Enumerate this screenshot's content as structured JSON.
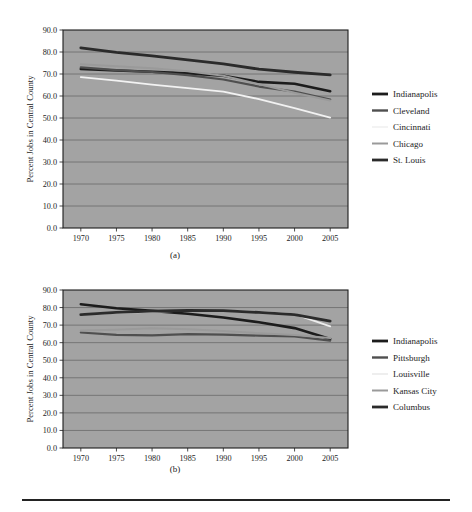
{
  "figure": {
    "caption_a": "(a)",
    "caption_b": "(b)"
  },
  "chart_data": [
    {
      "id": "a",
      "type": "line",
      "title": "",
      "xlabel": "Year",
      "ylabel": "Percent Jobs in Central County",
      "x": [
        1970,
        1975,
        1980,
        1985,
        1990,
        1995,
        2000,
        2005
      ],
      "xlim": [
        1967.5,
        2007.5
      ],
      "ylim": [
        0.0,
        90.0
      ],
      "xticks": [
        "1970",
        "1975",
        "1980",
        "1985",
        "1990",
        "1995",
        "2000",
        "2005"
      ],
      "yticks": [
        "0.0",
        "10.0",
        "20.0",
        "30.0",
        "40.0",
        "50.0",
        "60.0",
        "70.0",
        "80.0",
        "90.0"
      ],
      "grid": "horizontal",
      "legend_position": "right",
      "plot_background": "#a3a3a3",
      "gridline_color": "#6f6f6f",
      "series": [
        {
          "name": "Indianapolis",
          "color": "#1c1c1c",
          "width": 2.6,
          "values": [
            72.3,
            71.6,
            71.0,
            70.3,
            69.2,
            66.4,
            65.6,
            62.2
          ]
        },
        {
          "name": "Cleveland",
          "color": "#4f4f4f",
          "width": 2.2,
          "values": [
            73.0,
            71.8,
            70.9,
            69.5,
            67.5,
            64.3,
            62.0,
            58.4
          ]
        },
        {
          "name": "Cincinnati",
          "color": "#f2f2f2",
          "width": 1.8,
          "values": [
            68.6,
            67.0,
            65.2,
            63.6,
            62.0,
            58.6,
            54.5,
            50.2
          ]
        },
        {
          "name": "Chicago",
          "color": "#9a9a9a",
          "width": 2.0,
          "values": [
            74.4,
            73.5,
            72.6,
            71.3,
            69.2,
            65.4,
            61.5,
            58.0
          ]
        },
        {
          "name": "St. Louis",
          "color": "#2b2b2b",
          "width": 2.8,
          "values": [
            81.9,
            79.8,
            78.2,
            76.4,
            74.6,
            72.2,
            70.8,
            69.6
          ]
        }
      ],
      "legend": [
        {
          "label": "Indianapolis",
          "color": "#1c1c1c",
          "width": 2.8
        },
        {
          "label": "Cleveland",
          "color": "#4f4f4f",
          "width": 2.4
        },
        {
          "label": "Cincinnati",
          "color": "#f2f2f2",
          "width": 1.8
        },
        {
          "label": "Chicago",
          "color": "#9a9a9a",
          "width": 2.0
        },
        {
          "label": "St. Louis",
          "color": "#2b2b2b",
          "width": 2.8
        }
      ]
    },
    {
      "id": "b",
      "type": "line",
      "title": "",
      "xlabel": "Year",
      "ylabel": "Percent Jobs in Central County",
      "x": [
        1970,
        1975,
        1980,
        1985,
        1990,
        1995,
        2000,
        2005
      ],
      "xlim": [
        1967.5,
        2007.5
      ],
      "ylim": [
        0.0,
        90.0
      ],
      "xticks": [
        "1970",
        "1975",
        "1980",
        "1985",
        "1990",
        "1995",
        "2000",
        "2005"
      ],
      "yticks": [
        "0.0",
        "10.0",
        "20.0",
        "30.0",
        "40.0",
        "50.0",
        "60.0",
        "70.0",
        "80.0",
        "90.0"
      ],
      "grid": "horizontal",
      "legend_position": "right",
      "plot_background": "#a3a3a3",
      "gridline_color": "#6f6f6f",
      "series": [
        {
          "name": "Indianapolis",
          "color": "#1c1c1c",
          "width": 2.6,
          "values": [
            81.9,
            79.6,
            78.1,
            76.5,
            74.3,
            71.6,
            68.3,
            62.1
          ]
        },
        {
          "name": "Pittsburgh",
          "color": "#4f4f4f",
          "width": 2.2,
          "values": [
            65.8,
            64.4,
            64.2,
            64.9,
            64.6,
            64.0,
            63.6,
            61.2
          ]
        },
        {
          "name": "Louisville",
          "color": "#ededed",
          "width": 1.8,
          "values": [
            76.1,
            77.0,
            77.6,
            78.2,
            78.1,
            77.5,
            76.3,
            69.3
          ]
        },
        {
          "name": "Kansas City",
          "color": "#9a9a9a",
          "width": 2.0,
          "values": [
            66.9,
            67.4,
            68.2,
            67.6,
            66.6,
            65.4,
            64.4,
            62.6
          ]
        },
        {
          "name": "Columbus",
          "color": "#2b2b2b",
          "width": 2.8,
          "values": [
            76.0,
            77.2,
            78.0,
            78.4,
            78.2,
            77.2,
            76.0,
            72.3
          ]
        }
      ],
      "legend": [
        {
          "label": "Indianapolis",
          "color": "#1c1c1c",
          "width": 2.8
        },
        {
          "label": "Pittsburgh",
          "color": "#4f4f4f",
          "width": 2.4
        },
        {
          "label": "Louisville",
          "color": "#ededed",
          "width": 1.8
        },
        {
          "label": "Kansas City",
          "color": "#9a9a9a",
          "width": 2.0
        },
        {
          "label": "Columbus",
          "color": "#2b2b2b",
          "width": 2.8
        }
      ]
    }
  ]
}
